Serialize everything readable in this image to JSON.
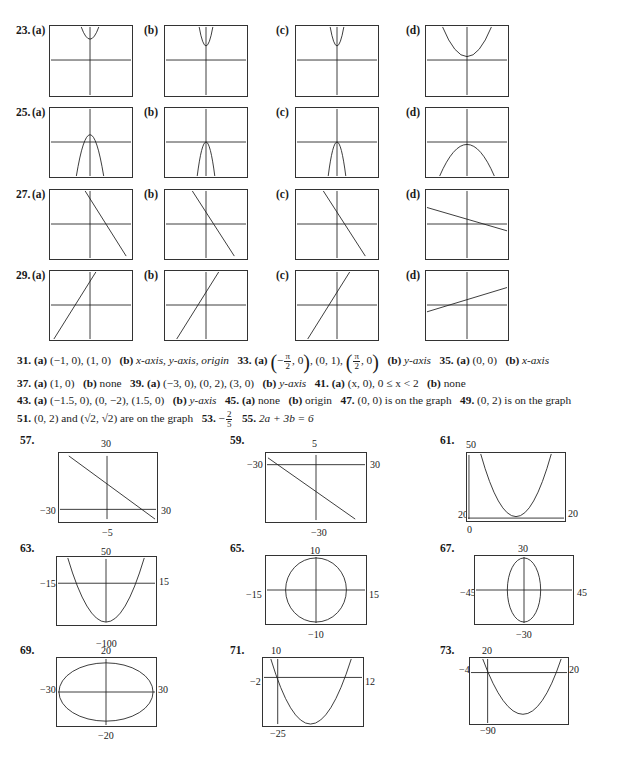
{
  "exercise_grid": {
    "rows": [
      {
        "number": "23.",
        "parts": [
          "(a)",
          "(b)",
          "(c)",
          "(d)"
        ],
        "graph": "upward parabolas"
      },
      {
        "number": "25.",
        "parts": [
          "(a)",
          "(b)",
          "(c)",
          "(d)"
        ],
        "graph": "downward parabolas"
      },
      {
        "number": "27.",
        "parts": [
          "(a)",
          "(b)",
          "(c)",
          "(d)"
        ],
        "graph": "decreasing lines"
      },
      {
        "number": "29.",
        "parts": [
          "(a)",
          "(b)",
          "(c)",
          "(d)"
        ],
        "graph": "increasing lines"
      }
    ]
  },
  "answers": {
    "line1": {
      "n31": "31.",
      "a": "(a)",
      "v31a": "(−1, 0), (1, 0)",
      "b": "(b)",
      "v31b": "x-axis, y-axis, origin",
      "n33": "33.",
      "a33": "(a)",
      "frac_num": "π",
      "frac_den": "2",
      "v33a_mid": "(0, 1),",
      "b33": "(b)",
      "v33b": "y-axis",
      "n35": "35.",
      "a35": "(a)",
      "v35a": "(0, 0)",
      "b35": "(b)",
      "v35b": "x-axis"
    },
    "line2": {
      "n37": "37.",
      "a": "(a)",
      "v37a": "(1, 0)",
      "b": "(b)",
      "v37b": "none",
      "n39": "39.",
      "a39": "(a)",
      "v39a": "(−3, 0), (0, 2), (3, 0)",
      "b39": "(b)",
      "v39b": "y-axis",
      "n41": "41.",
      "a41": "(a)",
      "v41a": "(x, 0), 0 ≤ x < 2",
      "b41": "(b)",
      "v41b": "none"
    },
    "line3": {
      "n43": "43.",
      "a": "(a)",
      "v43a": "(−1.5, 0), (0, −2), (1.5, 0)",
      "b": "(b)",
      "v43b": "y-axis",
      "n45": "45.",
      "a45": "(a)",
      "v45a": "none",
      "b45": "(b)",
      "v45b": "origin",
      "n47": "47.",
      "v47": "(0, 0) is on the graph",
      "n49": "49.",
      "v49": "(0, 2) is on the graph"
    },
    "line4": {
      "n51": "51.",
      "v51": "(0, 2) and (√2, √2) are on the graph",
      "n53": "53.",
      "v53_sign": "−",
      "v53_num": "2",
      "v53_den": "5",
      "n55": "55.",
      "v55": "2a + 3b = 6"
    }
  },
  "window_graphs": [
    {
      "number": "57.",
      "top": "30",
      "bottom": "−5",
      "left": "−30",
      "right": "30"
    },
    {
      "number": "59.",
      "top": "5",
      "bottom": "−30",
      "left": "−30",
      "right": "30"
    },
    {
      "number": "61.",
      "top": "50",
      "bottom": "0",
      "left": "0",
      "right": "20"
    },
    {
      "number": "63.",
      "top": "50",
      "bottom": "−100",
      "left": "−15",
      "right": "15"
    },
    {
      "number": "65.",
      "top": "10",
      "bottom": "−10",
      "left": "−15",
      "right": "15"
    },
    {
      "number": "67.",
      "top": "30",
      "bottom": "−30",
      "left": "−45",
      "right": "45"
    },
    {
      "number": "69.",
      "top": "20",
      "bottom": "−20",
      "left": "−30",
      "right": "30"
    },
    {
      "number": "71.",
      "top": "10",
      "bottom": "−25",
      "left": "−2",
      "right": "12"
    },
    {
      "number": "73.",
      "top": "20",
      "bottom": "−90",
      "left": "−4",
      "right": "20"
    }
  ],
  "colors": {
    "ink": "#1a1a1a",
    "frame": "#333333",
    "background": "#ffffff"
  }
}
